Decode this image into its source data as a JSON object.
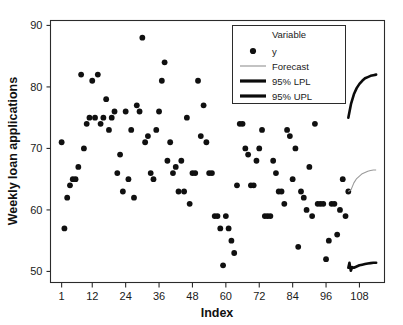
{
  "chart_data": {
    "type": "scatter",
    "title": "",
    "xlabel": "Index",
    "ylabel": "Weekly loan applications",
    "xlim": [
      -3,
      117
    ],
    "ylim": [
      48.2,
      90.8
    ],
    "xticks": [
      1,
      12,
      24,
      36,
      48,
      60,
      72,
      84,
      96,
      108
    ],
    "yticks": [
      50,
      60,
      70,
      80,
      90
    ],
    "grid": false,
    "legend_position": "top-right",
    "legend_title": "Variable",
    "series": [
      {
        "name": "y",
        "marker": "filled-circle",
        "color": "#101010",
        "x": [
          1,
          2,
          3,
          4,
          5,
          6,
          7,
          8,
          9,
          10,
          11,
          12,
          13,
          14,
          15,
          16,
          17,
          18,
          19,
          20,
          21,
          22,
          23,
          24,
          25,
          26,
          27,
          28,
          29,
          30,
          31,
          32,
          33,
          34,
          35,
          36,
          37,
          38,
          39,
          40,
          41,
          42,
          43,
          44,
          45,
          46,
          47,
          48,
          49,
          50,
          51,
          52,
          53,
          54,
          55,
          56,
          57,
          58,
          59,
          60,
          61,
          62,
          63,
          64,
          65,
          66,
          67,
          68,
          69,
          70,
          71,
          72,
          73,
          74,
          75,
          76,
          77,
          78,
          79,
          80,
          81,
          82,
          83,
          84,
          85,
          86,
          87,
          88,
          89,
          90,
          91,
          92,
          93,
          94,
          95,
          96,
          97,
          98,
          99,
          100,
          101,
          102,
          103,
          104
        ],
        "y": [
          71,
          57,
          62,
          64,
          65,
          65,
          67,
          82,
          70,
          74,
          75,
          81,
          75,
          82,
          74,
          75,
          78,
          73,
          75,
          76,
          66,
          69,
          63,
          76,
          65,
          73,
          62,
          77,
          76,
          88,
          71,
          72,
          66,
          65,
          73,
          76,
          81,
          84,
          68,
          71,
          66,
          67,
          63,
          68,
          63,
          75,
          61,
          66,
          66,
          81,
          72,
          77,
          71,
          66,
          66,
          59,
          59,
          57,
          51,
          59,
          57,
          55,
          53,
          64,
          74,
          74,
          70,
          69,
          64,
          64,
          68,
          70,
          73,
          59,
          59,
          59,
          68,
          66,
          63,
          63,
          61,
          73,
          72,
          65,
          70,
          54,
          63,
          62,
          60,
          67,
          59,
          74,
          61,
          61,
          61,
          52,
          55,
          61,
          61,
          56,
          60,
          65,
          59,
          63
        ]
      }
    ],
    "forecast": {
      "name": "Forecast",
      "color": "#9a9a9a",
      "x": [
        104,
        105,
        106,
        107,
        108,
        109,
        110,
        111,
        112,
        113,
        114
      ],
      "y": [
        63.0,
        63.3,
        64.4,
        65.1,
        65.5,
        65.9,
        66.1,
        66.3,
        66.4,
        66.5,
        66.5
      ]
    },
    "upl": {
      "name": "95% UPL",
      "color": "#0b0b0b",
      "x": [
        104,
        105,
        106,
        107,
        108,
        109,
        110,
        111,
        112,
        113,
        114
      ],
      "y": [
        75.0,
        77.3,
        78.8,
        79.8,
        80.5,
        81.0,
        81.4,
        81.6,
        81.8,
        81.9,
        82.0
      ]
    },
    "lpl": {
      "name": "95% LPL",
      "color": "#0b0b0b",
      "x": [
        104,
        104.4,
        104.9,
        105.4,
        106,
        107,
        108,
        109,
        110,
        111,
        112,
        113,
        114
      ],
      "y": [
        50.6,
        51.4,
        50.1,
        50.7,
        50.6,
        50.8,
        51.0,
        51.1,
        51.2,
        51.3,
        51.35,
        51.4,
        51.4
      ]
    }
  },
  "legend": {
    "title": "Variable",
    "entries": [
      {
        "label": "y",
        "kind": "marker"
      },
      {
        "label": "Forecast",
        "kind": "thin-line"
      },
      {
        "label": "95% LPL",
        "kind": "thick-line"
      },
      {
        "label": "95% UPL",
        "kind": "thick-line"
      }
    ]
  },
  "axes": {
    "x_title": "Index",
    "y_title": "Weekly loan applications",
    "x_tick_labels": [
      "1",
      "12",
      "24",
      "36",
      "48",
      "60",
      "72",
      "84",
      "96",
      "108"
    ],
    "y_tick_labels": [
      "50",
      "60",
      "70",
      "80",
      "90"
    ]
  }
}
